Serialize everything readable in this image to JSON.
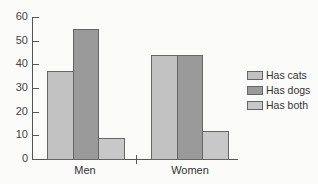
{
  "chart_data": {
    "type": "bar",
    "title": "",
    "xlabel": "",
    "ylabel": "",
    "categories": [
      "Men",
      "Women"
    ],
    "series": [
      {
        "name": "Has cats",
        "values": [
          37,
          44
        ],
        "color": "#c2c2c2"
      },
      {
        "name": "Has dogs",
        "values": [
          55,
          44
        ],
        "color": "#9a9a9a"
      },
      {
        "name": "Has both",
        "values": [
          9,
          12
        ],
        "color": "#c8c8c8"
      }
    ],
    "ylim": [
      0,
      60
    ],
    "yticks": [
      0,
      10,
      20,
      30,
      40,
      50,
      60
    ],
    "grid": false,
    "legend_position": "right"
  },
  "legend": {
    "items": [
      {
        "label": "Has cats"
      },
      {
        "label": "Has dogs"
      },
      {
        "label": "Has both"
      }
    ]
  },
  "axis": {
    "ytick_labels": [
      "0",
      "10",
      "20",
      "30",
      "40",
      "50",
      "60"
    ],
    "x_labels": [
      "Men",
      "Women"
    ]
  }
}
